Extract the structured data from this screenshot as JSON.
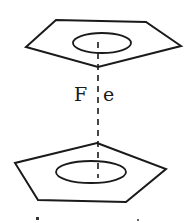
{
  "diagram": {
    "metal_label_left": "F",
    "metal_label_right": "e",
    "components": {
      "top_ring": "cyclopentadienyl ring (top)",
      "bottom_ring": "cyclopentadienyl ring (bottom)",
      "axis": "dashed metal-ring axis"
    },
    "colors": {
      "stroke": "#1a1a1a",
      "background": "#ffffff"
    }
  }
}
